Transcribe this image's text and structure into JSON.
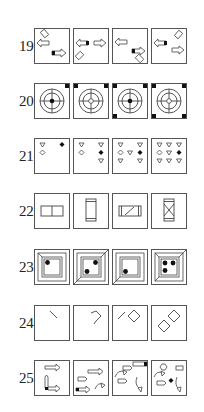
{
  "questions": [
    {
      "number": "19.",
      "top": 28,
      "panels": [
        "arrows-1",
        "arrows-2",
        "arrows-3",
        "arrows-4"
      ]
    },
    {
      "number": "20.",
      "top": 83,
      "panels": [
        "target-1",
        "target-2",
        "target-3",
        "target-4"
      ]
    },
    {
      "number": "21.",
      "top": 138,
      "panels": [
        "hearts-1",
        "hearts-2",
        "hearts-3",
        "hearts-4"
      ]
    },
    {
      "number": "22.",
      "top": 193,
      "panels": [
        "rect-1",
        "rect-2",
        "rect-3",
        "rect-4"
      ]
    },
    {
      "number": "23.",
      "top": 249,
      "panels": [
        "frame-1",
        "frame-2",
        "frame-3",
        "frame-4"
      ]
    },
    {
      "number": "24.",
      "top": 305,
      "panels": [
        "lines-1",
        "lines-2",
        "lines-3",
        "lines-4"
      ]
    },
    {
      "number": "25.",
      "top": 360,
      "panels": [
        "mixed-1",
        "mixed-2",
        "mixed-3",
        "mixed-4"
      ]
    }
  ],
  "panel_x": [
    34,
    73,
    112,
    151
  ],
  "colors": {
    "stroke": "#444444",
    "fill": "#111111",
    "border": "#555555"
  }
}
